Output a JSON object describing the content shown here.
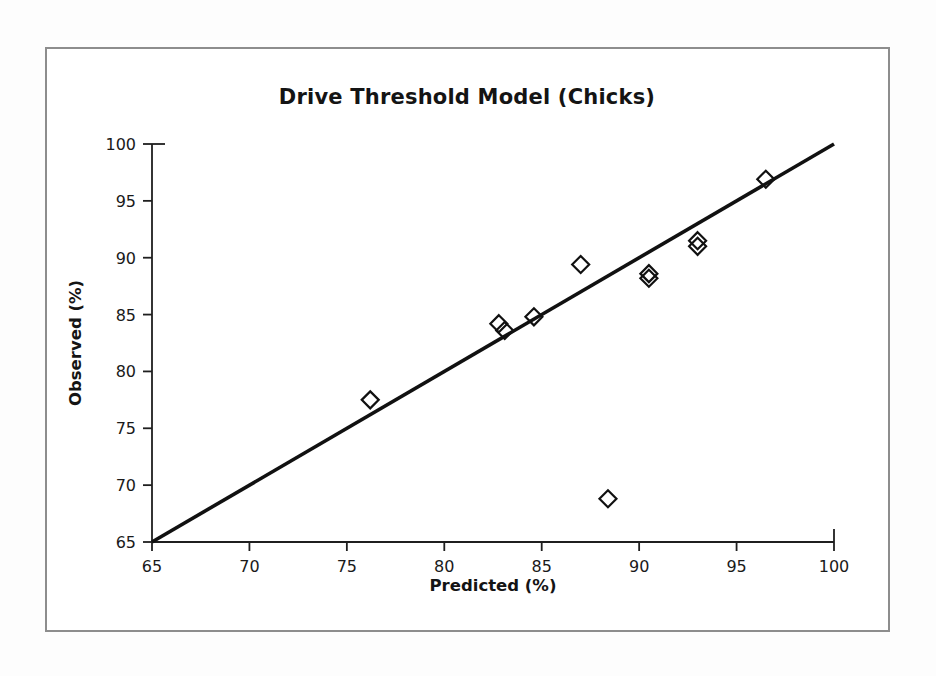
{
  "figure": {
    "title": "Drive Threshold Model (Chicks)",
    "border_color": "#8d8d8d",
    "background": "#ffffff"
  },
  "chart_data": {
    "type": "scatter",
    "title": "Drive Threshold Model (Chicks)",
    "xlabel": "Predicted (%)",
    "ylabel": "Observed (%)",
    "xlim": [
      65,
      100
    ],
    "ylim": [
      65,
      100
    ],
    "xticks": [
      65,
      70,
      75,
      80,
      85,
      90,
      95,
      100
    ],
    "yticks": [
      65,
      70,
      75,
      80,
      85,
      90,
      95,
      100
    ],
    "xticklabels": [
      "65",
      "70",
      "75",
      "80",
      "85",
      "90",
      "95",
      "100"
    ],
    "yticklabels": [
      "65",
      "70",
      "75",
      "80",
      "85",
      "90",
      "95",
      "100"
    ],
    "grid": false,
    "legend": false,
    "marker": "open-diamond",
    "marker_color": "#111111",
    "series": [
      {
        "name": "Observations",
        "points": [
          {
            "x": 76.2,
            "y": 77.5
          },
          {
            "x": 82.8,
            "y": 84.2
          },
          {
            "x": 83.1,
            "y": 83.6
          },
          {
            "x": 84.6,
            "y": 84.8
          },
          {
            "x": 87.0,
            "y": 89.4
          },
          {
            "x": 88.4,
            "y": 68.8
          },
          {
            "x": 90.5,
            "y": 88.6
          },
          {
            "x": 90.5,
            "y": 88.2
          },
          {
            "x": 93.0,
            "y": 91.5
          },
          {
            "x": 93.0,
            "y": 91.0
          },
          {
            "x": 96.5,
            "y": 96.9
          }
        ]
      }
    ],
    "reference_line": {
      "name": "1:1 identity line",
      "x0": 65,
      "y0": 65,
      "x1": 100,
      "y1": 100,
      "color": "#111111"
    }
  }
}
